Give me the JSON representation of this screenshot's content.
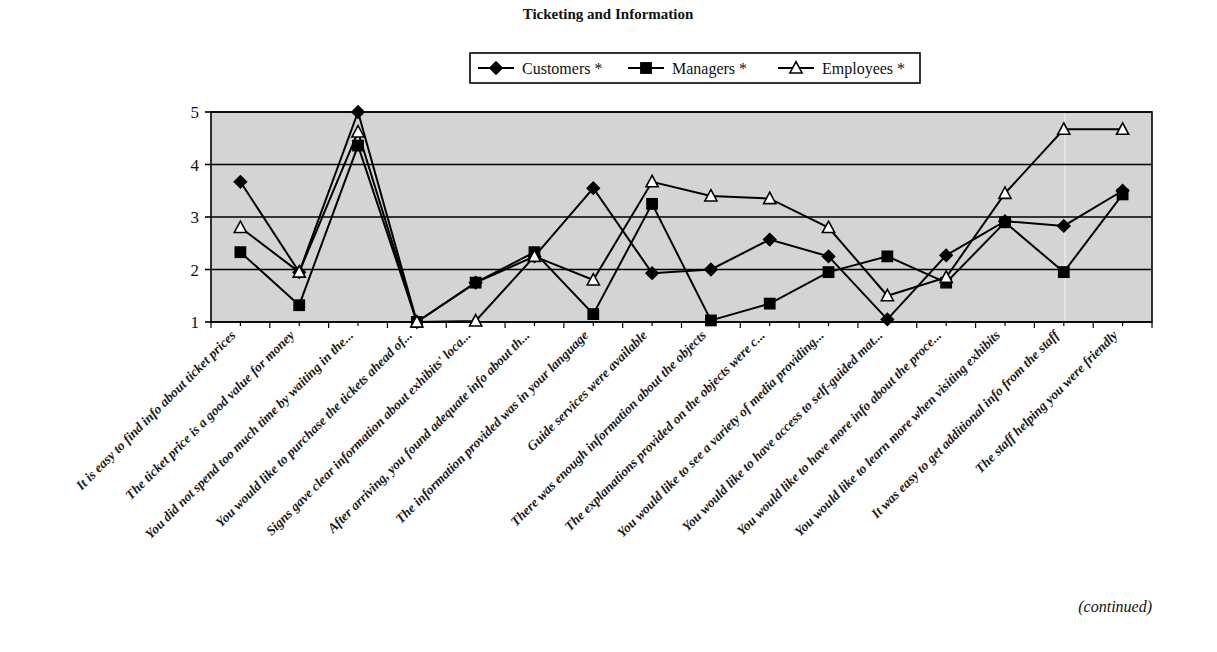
{
  "figure": {
    "title": "Ticketing and Information",
    "footer_note": "(continued)"
  },
  "legend": {
    "position": "top-center",
    "entries": [
      {
        "label": "Customers *",
        "marker": "diamond-filled-marker"
      },
      {
        "label": "Managers *",
        "marker": "square-filled-marker"
      },
      {
        "label": "Employees *",
        "marker": "triangle-open-marker"
      }
    ]
  },
  "chart_data": {
    "type": "line",
    "title": "Ticketing and Information",
    "xlabel": "",
    "ylabel": "",
    "ylim": [
      1,
      5
    ],
    "yticks": [
      1,
      2,
      3,
      4,
      5
    ],
    "ytick_labels": [
      "1",
      "2",
      "3",
      "4",
      "5"
    ],
    "grid": true,
    "legend_position": "top-center",
    "categories": [
      "It is easy to find info about ticket prices",
      "The ticket price is a good value for money",
      "You did not spend too much time by waiting in the...",
      "You would like to purchase the tickets ahead of...",
      "Signs gave clear information about exhibits' loca...",
      "After arriving, you found adequate info about th...",
      "The information provided was in your language",
      "Guide services were available",
      "There was enough information about the objects",
      "The explanations provided on the objects were c...",
      "You would like to see a variety of media providing...",
      "You would like to have access to self-guided mat...",
      "You would like to have more info about the proce...",
      "You would like to learn more when visiting exhibits",
      "It was easy to get additional info from the staff",
      "The staff helping you were friendly"
    ],
    "series": [
      {
        "name": "Customers *",
        "marker": "diamond-filled",
        "values": [
          3.67,
          1.95,
          5.0,
          1.0,
          1.75,
          2.25,
          3.55,
          1.93,
          2.0,
          2.57,
          2.25,
          1.05,
          2.27,
          2.92,
          2.83,
          3.5
        ]
      },
      {
        "name": "Managers *",
        "marker": "square-filled",
        "values": [
          2.33,
          1.32,
          4.36,
          1.0,
          1.75,
          2.33,
          1.15,
          3.25,
          1.03,
          1.35,
          1.95,
          2.25,
          1.75,
          2.9,
          1.95,
          3.43
        ]
      },
      {
        "name": "Employees *",
        "marker": "triangle-open",
        "values": [
          2.8,
          1.95,
          4.62,
          1.0,
          1.02,
          2.25,
          1.8,
          3.67,
          3.4,
          3.35,
          2.8,
          1.5,
          1.85,
          3.45,
          4.67,
          4.67
        ]
      }
    ]
  }
}
